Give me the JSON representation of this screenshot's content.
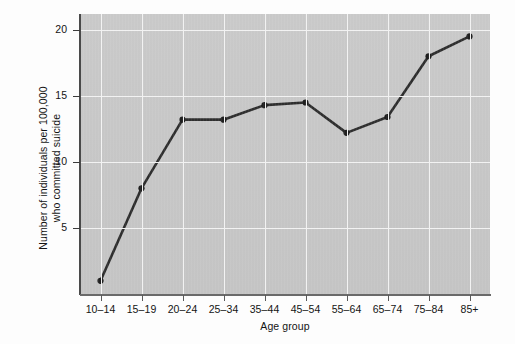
{
  "chart_data": {
    "type": "line",
    "title": "",
    "xlabel": "Age group",
    "ylabel": "Number of individuals per 100,000\nwho committed suicide",
    "categories": [
      "10–14",
      "15–19",
      "20–24",
      "25–34",
      "35–44",
      "45–54",
      "55–64",
      "65–74",
      "75–84",
      "85+"
    ],
    "values": [
      1.0,
      8.0,
      13.2,
      13.2,
      14.3,
      14.5,
      12.2,
      13.4,
      18.0,
      19.5
    ],
    "series": [
      {
        "name": "Suicide rate",
        "values": [
          1.0,
          8.0,
          13.2,
          13.2,
          14.3,
          14.5,
          12.2,
          13.4,
          18.0,
          19.5
        ]
      }
    ],
    "ylim": [
      0,
      21.2
    ],
    "yticks": [
      5,
      10,
      15,
      20
    ],
    "ytick_labels": [
      "5",
      "10",
      "15",
      "20"
    ],
    "grid": "both",
    "legend": "none",
    "marker": "circle",
    "line_color": "#2e2e2e",
    "marker_color": "#1f1f1f",
    "plot_background": "#c7c7c7",
    "gridline_color": "#f2f2f2",
    "figure_background": "#fdfdfd"
  }
}
